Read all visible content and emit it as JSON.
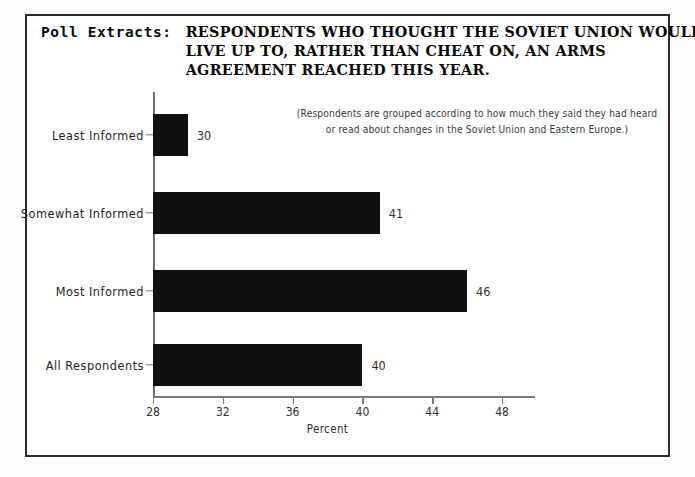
{
  "document": {
    "kind": "poll-extract-chart",
    "eyebrow": "Poll Extracts:",
    "headline_lines": [
      "RESPONDENTS WHO THOUGHT THE SOVIET UNION WOULD",
      "LIVE UP TO, RATHER THAN CHEAT ON, AN ARMS",
      "AGREEMENT REACHED THIS YEAR."
    ],
    "note_lines": [
      "(Respondents are grouped according to how much they said they had heard",
      "or read about changes in the Soviet Union and Eastern Europe.)"
    ]
  },
  "chart_data": {
    "type": "bar",
    "orientation": "horizontal",
    "title": "RESPONDENTS WHO THOUGHT THE SOVIET UNION WOULD LIVE UP TO, RATHER THAN CHEAT ON, AN ARMS AGREEMENT REACHED THIS YEAR.",
    "subtitle": "(Respondents are grouped according to how much they said they had heard or read about changes in the Soviet Union and Eastern Europe.)",
    "categories": [
      "Least Informed",
      "Somewhat Informed",
      "Most Informed",
      "All Respondents"
    ],
    "values": [
      30,
      41,
      46,
      40
    ],
    "value_labels": [
      "30",
      "41",
      "46",
      "40"
    ],
    "xlabel": "Percent",
    "ylabel": "",
    "xlim": [
      28,
      48
    ],
    "xticks": [
      28,
      32,
      36,
      40,
      44,
      48
    ],
    "xtick_labels": [
      "28",
      "32",
      "36",
      "40",
      "44",
      "48"
    ],
    "grid": false,
    "legend": false,
    "bar_color": "#111111",
    "axis_color": "#7a7a7a",
    "frame_color": "#2b2b2b",
    "background": "#ffffff"
  }
}
